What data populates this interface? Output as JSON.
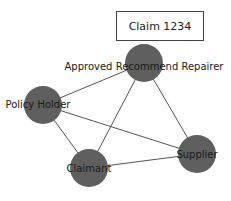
{
  "diagram": {
    "title": "Claim 1234",
    "node_color": "#5f5f5f",
    "edge_color": "#555555",
    "nodes": [
      {
        "id": "arr",
        "label": "Approved Recommend Repairer",
        "cx": 144,
        "cy": 63,
        "r": 19,
        "lx": 144,
        "ly": 70
      },
      {
        "id": "ph",
        "label": "Policy Holder",
        "cx": 43,
        "cy": 105,
        "r": 19,
        "lx": 38,
        "ly": 108
      },
      {
        "id": "cl",
        "label": "Claimant",
        "cx": 89,
        "cy": 168,
        "r": 19,
        "lx": 89,
        "ly": 172
      },
      {
        "id": "su",
        "label": "Supplier",
        "cx": 197,
        "cy": 154,
        "r": 19,
        "lx": 197,
        "ly": 158
      }
    ],
    "edges": [
      {
        "from": "arr",
        "to": "ph"
      },
      {
        "from": "arr",
        "to": "cl"
      },
      {
        "from": "arr",
        "to": "su"
      },
      {
        "from": "ph",
        "to": "cl"
      },
      {
        "from": "ph",
        "to": "su"
      },
      {
        "from": "cl",
        "to": "su"
      }
    ]
  }
}
